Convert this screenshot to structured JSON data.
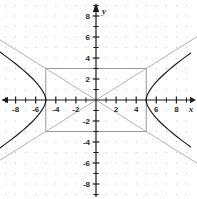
{
  "chart_data": {
    "type": "line",
    "title": "",
    "subtitle": "",
    "xlabel": "x",
    "ylabel": "y",
    "xlim": [
      -9.6,
      10.1
    ],
    "ylim": [
      -9.4,
      9.5
    ],
    "grid": "dotted points at integer lattice",
    "legend_position": "none",
    "x_ticks": [
      -8,
      -6,
      -4,
      -2,
      2,
      4,
      6,
      8
    ],
    "y_ticks": [
      8,
      6,
      4,
      2,
      -2,
      -4,
      -6,
      -8
    ],
    "x_tick_labels": [
      "-8",
      "-6",
      "-4",
      "-2",
      "2",
      "4",
      "6",
      "8"
    ],
    "y_tick_labels": [
      "8",
      "6",
      "4",
      "2",
      "-2",
      "-4",
      "-6",
      "-8"
    ],
    "x_minor_ticks": [
      -9,
      -7,
      -5,
      -3,
      -1,
      1,
      3,
      5,
      7,
      9
    ],
    "y_minor_ticks": [
      9,
      7,
      5,
      3,
      1,
      -1,
      -3,
      -5,
      -7,
      -9
    ],
    "series": [
      {
        "name": "hyperbola-right-branch",
        "color": "#1a1a1a",
        "equation": "x^2/25 - y^2/9 = 1, x >= 5",
        "points": [
          [
            5.0,
            0.0
          ],
          [
            5.05,
            0.33
          ],
          [
            5.1,
            0.47
          ],
          [
            5.2,
            0.67
          ],
          [
            5.4,
            0.99
          ],
          [
            5.6,
            1.26
          ],
          [
            5.8,
            1.5
          ],
          [
            6.0,
            1.72
          ],
          [
            6.4,
            2.12
          ],
          [
            6.8,
            2.48
          ],
          [
            7.2,
            2.82
          ],
          [
            7.6,
            3.14
          ],
          [
            8.0,
            3.45
          ],
          [
            8.5,
            3.82
          ],
          [
            9.0,
            4.18
          ],
          [
            9.4,
            4.46
          ]
        ]
      },
      {
        "name": "hyperbola-right-branch-lower",
        "color": "#1a1a1a",
        "equation": "x^2/25 - y^2/9 = 1, x >= 5, y <= 0",
        "points": [
          [
            5.0,
            0.0
          ],
          [
            5.05,
            -0.33
          ],
          [
            5.1,
            -0.47
          ],
          [
            5.2,
            -0.67
          ],
          [
            5.4,
            -0.99
          ],
          [
            5.6,
            -1.26
          ],
          [
            5.8,
            -1.5
          ],
          [
            6.0,
            -1.72
          ],
          [
            6.4,
            -2.12
          ],
          [
            6.8,
            -2.48
          ],
          [
            7.2,
            -2.82
          ],
          [
            7.6,
            -3.14
          ],
          [
            8.0,
            -3.45
          ],
          [
            8.5,
            -3.82
          ],
          [
            9.0,
            -4.18
          ],
          [
            9.4,
            -4.46
          ]
        ]
      },
      {
        "name": "hyperbola-left-branch-upper",
        "color": "#1a1a1a",
        "equation": "x^2/25 - y^2/9 = 1, x <= -5, y >= 0",
        "points": [
          [
            -5.0,
            0.0
          ],
          [
            -5.05,
            0.33
          ],
          [
            -5.1,
            0.47
          ],
          [
            -5.2,
            0.67
          ],
          [
            -5.4,
            0.99
          ],
          [
            -5.6,
            1.26
          ],
          [
            -5.8,
            1.5
          ],
          [
            -6.0,
            1.72
          ],
          [
            -6.4,
            2.12
          ],
          [
            -6.8,
            2.48
          ],
          [
            -7.2,
            2.82
          ],
          [
            -7.6,
            3.14
          ],
          [
            -8.0,
            3.45
          ],
          [
            -8.5,
            3.82
          ],
          [
            -9.0,
            4.18
          ],
          [
            -9.6,
            4.6
          ]
        ]
      },
      {
        "name": "hyperbola-left-branch-lower",
        "color": "#1a1a1a",
        "equation": "x^2/25 - y^2/9 = 1, x <= -5, y <= 0",
        "points": [
          [
            -5.0,
            0.0
          ],
          [
            -5.05,
            -0.33
          ],
          [
            -5.1,
            -0.47
          ],
          [
            -5.2,
            -0.67
          ],
          [
            -5.4,
            -0.99
          ],
          [
            -5.6,
            -1.26
          ],
          [
            -5.8,
            -1.5
          ],
          [
            -6.0,
            -1.72
          ],
          [
            -6.4,
            -2.12
          ],
          [
            -6.8,
            -2.48
          ],
          [
            -7.2,
            -2.82
          ],
          [
            -7.6,
            -3.14
          ],
          [
            -8.0,
            -3.45
          ],
          [
            -8.5,
            -3.82
          ],
          [
            -9.0,
            -4.18
          ],
          [
            -9.6,
            -4.6
          ]
        ]
      },
      {
        "name": "asymptote-positive-slope",
        "color": "#b3b3b3",
        "equation": "y = 0.6x",
        "points": [
          [
            -9.6,
            -5.76
          ],
          [
            10.0,
            6.0
          ]
        ]
      },
      {
        "name": "asymptote-negative-slope",
        "color": "#b3b3b3",
        "equation": "y = -0.6x",
        "points": [
          [
            -9.6,
            5.76
          ],
          [
            10.0,
            -6.0
          ]
        ]
      }
    ],
    "annotations": [
      {
        "name": "central-rectangle",
        "type": "rect",
        "x_range": [
          -5,
          5
        ],
        "y_range": [
          -3,
          3
        ],
        "stroke": "#999999",
        "fill": "none"
      }
    ]
  },
  "axes": {
    "x_axis_label": "x",
    "y_axis_label": "y"
  },
  "colors": {
    "background": "#ffffff",
    "axis": "#1a1a1a",
    "grid_dot": "#c8c8d2",
    "curve": "#1a1a1a",
    "asymptote": "#b3b3b3",
    "rectangle": "#999999",
    "tick_text": "#2b2b2b"
  }
}
